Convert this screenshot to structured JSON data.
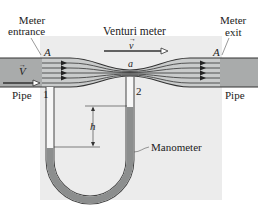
{
  "title": "Venturi meter",
  "labels": {
    "meter_entrance_line1": "Meter",
    "meter_entrance_line2": "entrance",
    "meter_exit_line1": "Meter",
    "meter_exit_line2": "exit",
    "venturi_meter": "Venturi meter",
    "area_entrance": "A",
    "area_exit": "A",
    "area_throat": "a",
    "velocity_throat": "v",
    "velocity_pipe": "V",
    "pipe_left": "Pipe",
    "pipe_right": "Pipe",
    "point_1": "1",
    "point_2": "2",
    "height": "h",
    "manometer": "Manometer"
  },
  "colors": {
    "panel": "#ececec",
    "pipe": "#a9abab",
    "meter_fill": "#c9cbcb",
    "throat_fill": "#d6d8d8",
    "outline": "#333333",
    "manometer_fluid": "#8c8e8e",
    "tube_glass": "#f7f7f7",
    "arrow_fill": "#ffffff"
  }
}
